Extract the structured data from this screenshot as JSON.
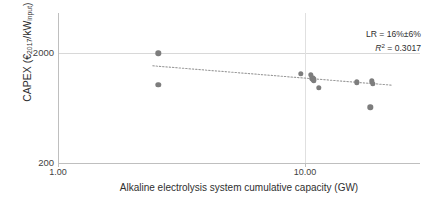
{
  "chart_data": {
    "type": "scatter",
    "title": "",
    "xlabel": "Alkaline electrolysis system cumulative capacity (GW)",
    "ylabel": "CAPEX (€2017/kWinput)",
    "xscale": "log",
    "yscale": "log",
    "xlim": [
      1.0,
      25.0
    ],
    "ylim": [
      200,
      2600
    ],
    "xticks": [
      "1.00",
      "10.00"
    ],
    "xtick_values": [
      1.0,
      10.0
    ],
    "yticks": [
      "2000",
      "200"
    ],
    "ytick_values": [
      2000,
      200
    ],
    "grid": "horizontal-and-vertical-at-ticks",
    "legend": "none",
    "marker_color": "#7d7d7d",
    "trend_color": "#9a9a9a",
    "trend_style": "dotted",
    "points": [
      {
        "x": 2.55,
        "y": 1980
      },
      {
        "x": 2.55,
        "y": 1030
      },
      {
        "x": 9.6,
        "y": 1290
      },
      {
        "x": 10.55,
        "y": 1270
      },
      {
        "x": 10.7,
        "y": 1180
      },
      {
        "x": 10.8,
        "y": 1155
      },
      {
        "x": 10.85,
        "y": 1120
      },
      {
        "x": 11.4,
        "y": 960
      },
      {
        "x": 16.2,
        "y": 1080
      },
      {
        "x": 18.6,
        "y": 1105
      },
      {
        "x": 18.8,
        "y": 1050
      },
      {
        "x": 18.4,
        "y": 640
      }
    ],
    "trend": {
      "x_start": 2.42,
      "y_start": 1530,
      "x_end": 22.5,
      "y_end": 1020,
      "learning_rate": "16%±6%",
      "r_squared": 0.3017
    },
    "annotation": {
      "learning_rate_line": "LR = 16%±6%",
      "r2_label": "R",
      "r2_sup": "2",
      "r2_value": " = 0.3017"
    }
  },
  "axis": {
    "y_title_main": "CAPEX (€",
    "y_title_sub1": "2017",
    "y_title_mid": "/kW",
    "y_title_sub2": "input",
    "y_title_end": ")",
    "x_title": "Alkaline electrolysis system cumulative capacity (GW)",
    "ytick_top": "2000",
    "ytick_bottom": "200",
    "xtick_left": "1.00",
    "xtick_right": "10.00"
  }
}
